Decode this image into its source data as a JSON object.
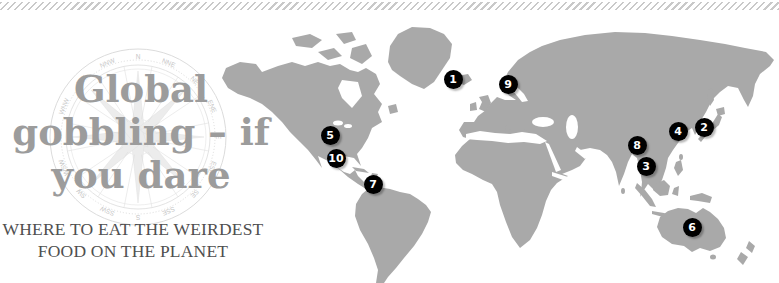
{
  "title": {
    "line1": "Global",
    "line2": "gobbling – if",
    "line3": "you dare"
  },
  "subtitle": {
    "line1": "WHERE TO EAT THE WEIRDEST",
    "line2": "FOOD ON THE PLANET"
  },
  "compass": {
    "labels": [
      "N",
      "NNE",
      "NE",
      "ENE",
      "E",
      "ESE",
      "SE",
      "SSE",
      "S",
      "SSW",
      "SW",
      "WSW",
      "W",
      "WNW",
      "NW",
      "NNW"
    ]
  },
  "colors": {
    "land": "#a9a9a9",
    "title": "#9c9c9c",
    "subtitle": "#4f4f4f",
    "hatch": "#c9c9c9",
    "compass": "#dcdcdc",
    "compass_label": "#c6c6c6",
    "marker_bg": "#000000",
    "marker_text": "#ffffff"
  },
  "map": {
    "markers": [
      {
        "number": "1",
        "x": 453,
        "y": 79
      },
      {
        "number": "2",
        "x": 704,
        "y": 127
      },
      {
        "number": "3",
        "x": 646,
        "y": 166
      },
      {
        "number": "4",
        "x": 678,
        "y": 131
      },
      {
        "number": "5",
        "x": 330,
        "y": 135
      },
      {
        "number": "6",
        "x": 692,
        "y": 227
      },
      {
        "number": "7",
        "x": 373,
        "y": 184
      },
      {
        "number": "8",
        "x": 637,
        "y": 145
      },
      {
        "number": "9",
        "x": 508,
        "y": 84
      },
      {
        "number": "10",
        "x": 336,
        "y": 158
      }
    ]
  }
}
